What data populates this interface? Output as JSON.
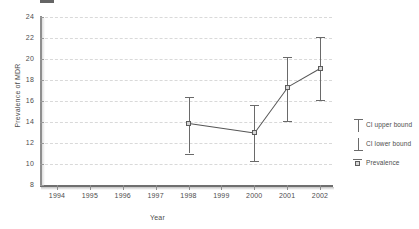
{
  "chart_data": {
    "type": "line",
    "title": "",
    "xlabel": "Year",
    "ylabel": "Prevalence of MDR",
    "x": [
      1994,
      1995,
      1996,
      1997,
      1998,
      1999,
      2000,
      2001,
      2002
    ],
    "xtick_labels": [
      "1994",
      "1995",
      "1996",
      "1997",
      "1998",
      "1999",
      "2000",
      "2001",
      "2002"
    ],
    "ytick_labels": [
      "24",
      "22",
      "20",
      "18",
      "16",
      "14",
      "12",
      "10",
      "8"
    ],
    "ylim": [
      8,
      24
    ],
    "xlim": [
      1994,
      2002
    ],
    "grid": true,
    "legend_position": "right",
    "series": [
      {
        "name": "Prevalence",
        "points": [
          {
            "year": 1998,
            "value": 13.9,
            "ci_lower": 11.0,
            "ci_upper": 16.4
          },
          {
            "year": 2000,
            "value": 13.0,
            "ci_lower": 10.3,
            "ci_upper": 15.6
          },
          {
            "year": 2001,
            "value": 17.3,
            "ci_lower": 14.1,
            "ci_upper": 20.2
          },
          {
            "year": 2002,
            "value": 19.1,
            "ci_lower": 16.1,
            "ci_upper": 22.1
          }
        ]
      }
    ],
    "legend": [
      {
        "key": "ci-upper-bound",
        "label": "CI upper bound"
      },
      {
        "key": "ci-lower-bound",
        "label": "CI lower bound"
      },
      {
        "key": "prevalence",
        "label": "Prevalence"
      }
    ],
    "colors": {
      "line": "#555555",
      "marker_fill": "#d6d6d6",
      "marker_stroke": "#5c5c5c",
      "error_bar": "#6a6a6a",
      "gridline": "#d9d9d9",
      "axis": "#8e8e8e",
      "text": "#4d4d4d",
      "background": "#ffffff"
    }
  }
}
